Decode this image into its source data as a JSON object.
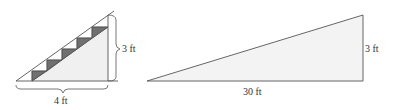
{
  "colors": {
    "line": "#555555",
    "fill_light": "#f0f0f0",
    "step_dark": "#707070",
    "text": "#333333"
  },
  "stairs_figure": {
    "height_label": "3 ft",
    "width_label": "4 ft",
    "step_count": 5
  },
  "ramp_figure": {
    "height_label": "3 ft",
    "base_label": "30 ft"
  }
}
